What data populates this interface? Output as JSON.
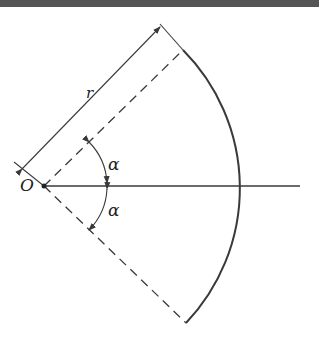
{
  "diagram": {
    "labels": {
      "origin": "O",
      "radius": "r",
      "alpha_upper": "α",
      "alpha_lower": "α"
    },
    "colors": {
      "ink": "#3a3a3a",
      "top_band": "#555555",
      "background": "#ffffff"
    }
  }
}
